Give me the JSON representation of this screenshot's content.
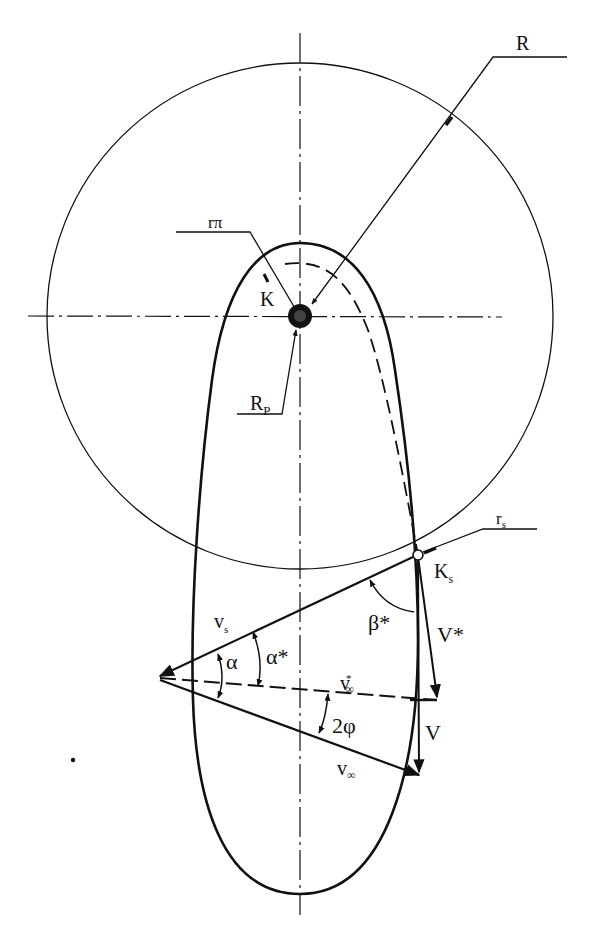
{
  "diagram": {
    "type": "orbital-geometry",
    "colors": {
      "ink": "#111111",
      "background": "#ffffff"
    },
    "circle": {
      "label": "R",
      "center": [
        300,
        316
      ],
      "radius": 253
    },
    "planet": {
      "label_center": "K",
      "label_radius": "R",
      "label_radius_sub": "P",
      "label_pericenter": "r",
      "label_pericenter_sub": "π"
    },
    "point_s": {
      "label": "K",
      "label_sub": "s",
      "radius_label": "r",
      "radius_label_sub": "s"
    },
    "vectors": {
      "v_s": {
        "label": "v",
        "label_sub": "s"
      },
      "v_inf_star": {
        "label": "v",
        "label_sub": "∞",
        "label_sup": "*"
      },
      "v_inf": {
        "label": "v",
        "label_sub": "∞"
      },
      "V_star": {
        "label": "V*"
      },
      "V": {
        "label": "V"
      }
    },
    "angles": {
      "alpha": "α",
      "alpha_star": "α*",
      "beta_star": "β*",
      "two_phi": "2φ"
    }
  }
}
